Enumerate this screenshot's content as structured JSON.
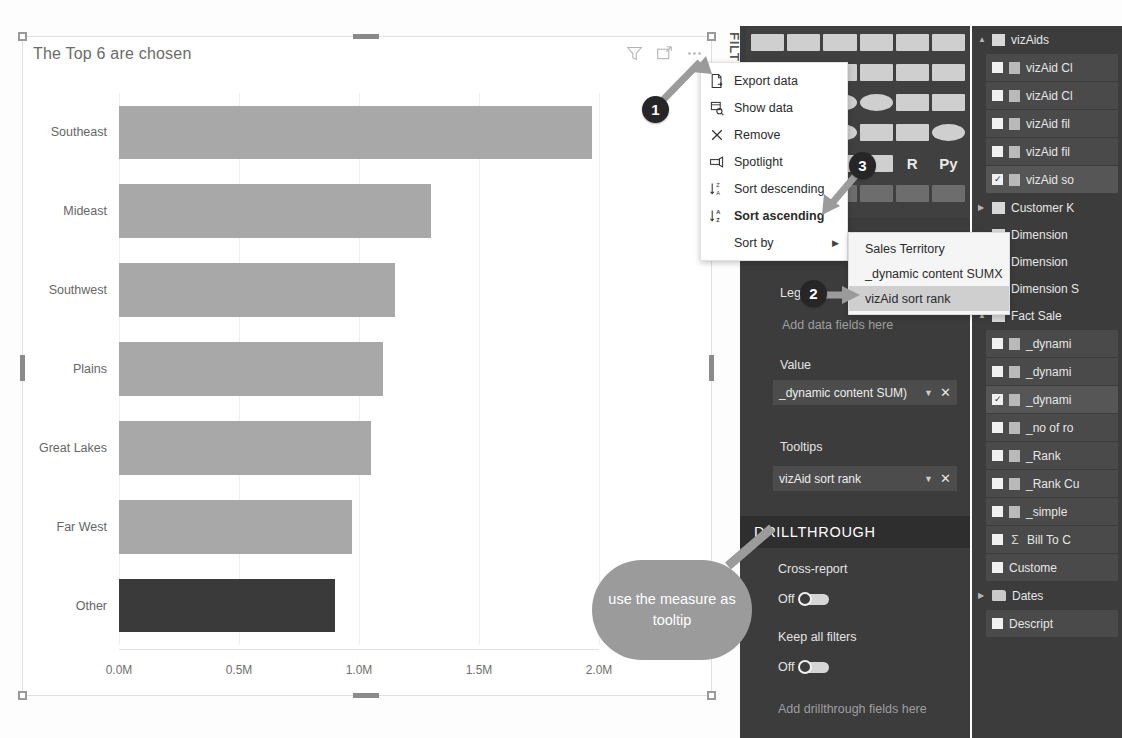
{
  "chart_data": {
    "type": "bar",
    "orientation": "horizontal",
    "title": "The Top 6 are chosen",
    "xlabel": "",
    "ylabel": "",
    "xlim": [
      0,
      2.0
    ],
    "x_tick_labels": [
      "0.0M",
      "0.5M",
      "1.0M",
      "1.5M",
      "2.0M"
    ],
    "x_tick_values": [
      0,
      0.5,
      1.0,
      1.5,
      2.0
    ],
    "grid": true,
    "legend": "none",
    "categories": [
      "Southeast",
      "Mideast",
      "Southwest",
      "Plains",
      "Great Lakes",
      "Far West",
      "Other"
    ],
    "values": [
      1.97,
      1.3,
      1.15,
      1.1,
      1.05,
      0.97,
      0.9
    ],
    "colors": [
      "#a8a8a8",
      "#a8a8a8",
      "#a8a8a8",
      "#a8a8a8",
      "#a8a8a8",
      "#a8a8a8",
      "#3a3a3a"
    ],
    "highlight_category": "Other"
  },
  "visual": {
    "title": "The Top 6 are chosen",
    "header_icons": [
      "filter-icon",
      "focus-mode-icon",
      "more-options-icon"
    ]
  },
  "context_menu": {
    "items": [
      {
        "label": "Export data",
        "icon": "export-data-icon",
        "bold": false,
        "submenu": false
      },
      {
        "label": "Show data",
        "icon": "show-data-icon",
        "bold": false,
        "submenu": false
      },
      {
        "label": "Remove",
        "icon": "remove-icon",
        "bold": false,
        "submenu": false
      },
      {
        "label": "Spotlight",
        "icon": "spotlight-icon",
        "bold": false,
        "submenu": false
      },
      {
        "label": "Sort descending",
        "icon": "sort-descending-icon",
        "bold": false,
        "submenu": false
      },
      {
        "label": "Sort ascending",
        "icon": "sort-ascending-icon",
        "bold": true,
        "submenu": false
      },
      {
        "label": "Sort by",
        "icon": "",
        "bold": false,
        "submenu": true
      }
    ]
  },
  "sort_submenu": {
    "items": [
      {
        "label": "Sales Territory",
        "selected": false
      },
      {
        "label": "_dynamic content SUMX",
        "selected": false
      },
      {
        "label": "vizAid sort rank",
        "selected": true
      }
    ]
  },
  "filters_pane": {
    "label": "FILTERS"
  },
  "viz_gallery": {
    "icons": [
      "stacked-bar-chart-icon",
      "stacked-column-chart-icon",
      "clustered-bar-chart-icon",
      "clustered-column-chart-icon",
      "100-stacked-bar-icon",
      "100-stacked-column-icon",
      "line-chart-icon",
      "area-chart-icon",
      "stacked-area-icon",
      "line-and-stacked-column-icon",
      "line-and-clustered-column-icon",
      "ribbon-chart-icon",
      "waterfall-chart-icon",
      "scatter-chart-icon",
      "pie-chart-icon",
      "donut-chart-icon",
      "treemap-icon",
      "map-icon",
      "filled-map-icon",
      "funnel-icon",
      "gauge-icon",
      "card-icon",
      "multi-row-card-icon",
      "globe-map-icon",
      "kpi-icon",
      "slicer-icon",
      "table-icon",
      "matrix-icon",
      "r-script-visual-icon",
      "python-visual-icon",
      "key-influencers-icon",
      "decomposition-tree-icon",
      "qna-visual-icon",
      "smart-narrative-icon",
      "paginated-report-icon",
      "get-more-visuals-icon"
    ],
    "text_icons": {
      "r": "R",
      "py": "Py"
    }
  },
  "field_wells": {
    "legend": {
      "label": "Legend",
      "placeholder": "Add data fields here"
    },
    "value": {
      "label": "Value",
      "chip": "_dynamic content SUM)"
    },
    "tooltips": {
      "label": "Tooltips",
      "chip": "vizAid sort rank"
    },
    "drillthrough": {
      "header": "DRILLTHROUGH",
      "cross_report_label": "Cross-report",
      "cross_report_state": "Off",
      "keep_all_filters_label": "Keep all filters",
      "keep_all_filters_state": "Off",
      "placeholder": "Add drillthrough fields here"
    }
  },
  "fields_pane": {
    "rows": [
      {
        "label": "vizAids",
        "type": "table",
        "expanded": true,
        "checked": false
      },
      {
        "label": "vizAid Cl",
        "type": "field",
        "checked": false,
        "selected": false
      },
      {
        "label": "vizAid Cl",
        "type": "field",
        "checked": false,
        "selected": false
      },
      {
        "label": "vizAid fil",
        "type": "field",
        "checked": false,
        "selected": false
      },
      {
        "label": "vizAid fil",
        "type": "field",
        "checked": false,
        "selected": false
      },
      {
        "label": "vizAid so",
        "type": "field",
        "checked": true,
        "selected": true
      },
      {
        "label": "Customer K",
        "type": "table",
        "expanded": false,
        "checked": false
      },
      {
        "label": "Dimension",
        "type": "table",
        "expanded": false,
        "checked": false
      },
      {
        "label": "Dimension",
        "type": "table",
        "expanded": false,
        "checked": false
      },
      {
        "label": "Dimension S",
        "type": "table",
        "expanded": false,
        "checked": false
      },
      {
        "label": "Fact Sale",
        "type": "table",
        "expanded": true,
        "checked": false
      },
      {
        "label": "_dynami",
        "type": "field",
        "checked": false,
        "selected": false
      },
      {
        "label": "_dynami",
        "type": "field",
        "checked": false,
        "selected": false
      },
      {
        "label": "_dynami",
        "type": "field",
        "checked": true,
        "selected": true
      },
      {
        "label": "_no of ro",
        "type": "field",
        "checked": false,
        "selected": false
      },
      {
        "label": "_Rank",
        "type": "field",
        "checked": false,
        "selected": false
      },
      {
        "label": "_Rank Cu",
        "type": "field",
        "checked": false,
        "selected": false
      },
      {
        "label": "_simple",
        "type": "field",
        "checked": false,
        "selected": false
      },
      {
        "label": "Bill To C",
        "type": "sigma",
        "checked": false,
        "selected": false
      },
      {
        "label": "Custome",
        "type": "plain",
        "checked": false,
        "selected": false
      },
      {
        "label": "Dates",
        "type": "folder",
        "expanded": false,
        "checked": false
      },
      {
        "label": "Descript",
        "type": "plain",
        "checked": false,
        "selected": false
      }
    ]
  },
  "annotations": {
    "badges": [
      {
        "number": "1",
        "x": 642,
        "y": 96
      },
      {
        "number": "2",
        "x": 800,
        "y": 280
      },
      {
        "number": "3",
        "x": 849,
        "y": 152
      }
    ],
    "callout": {
      "text": "use the measure as tooltip"
    }
  }
}
